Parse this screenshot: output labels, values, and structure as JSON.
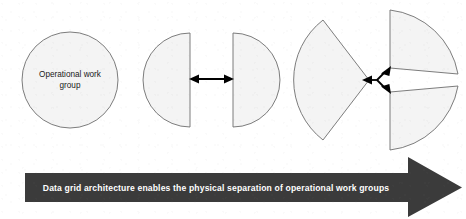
{
  "figure": {
    "background_color": "#ffffff",
    "shape_fill": "#f4f4f4",
    "shape_stroke": "#6e6e6e",
    "arrow_color": "#000000",
    "banner_color": "#3b3b3b",
    "banner_text_color": "#ffffff",
    "label_text_color": "#1a1a1a"
  },
  "stages": [
    {
      "name": "whole-group",
      "label_line1": "Operational work",
      "label_line2": "group",
      "segments": 1
    },
    {
      "name": "split-in-two",
      "label_line1": "",
      "label_line2": "",
      "segments": 2
    },
    {
      "name": "split-in-three",
      "label_line1": "",
      "label_line2": "",
      "segments": 3
    }
  ],
  "banner": {
    "caption": "Data grid architecture enables the physical separation of operational work groups"
  }
}
